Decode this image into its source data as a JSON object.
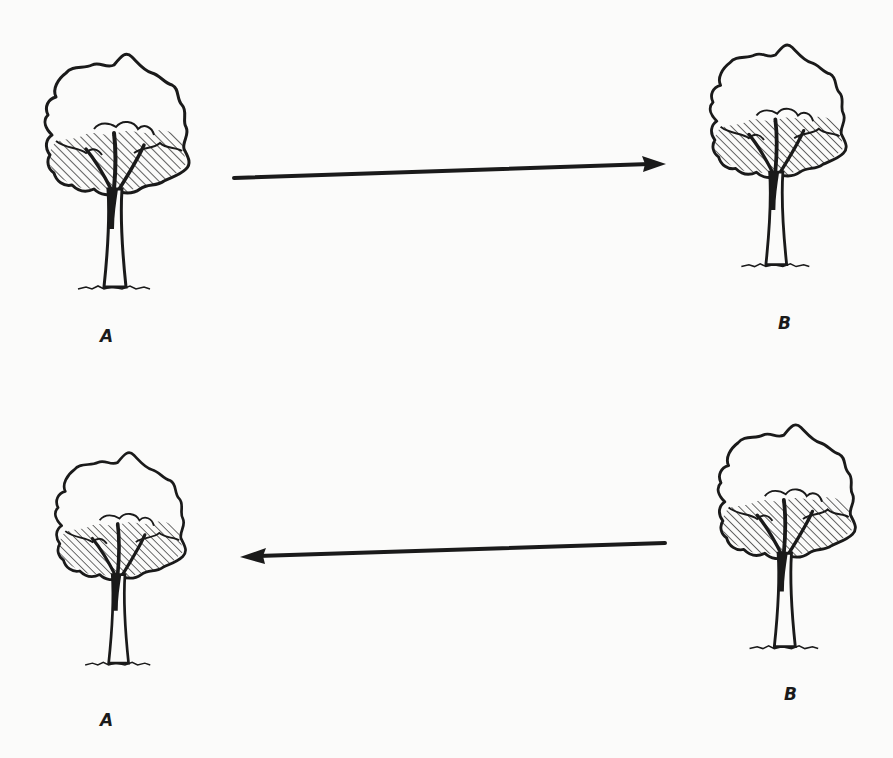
{
  "diagram": {
    "ink_color": "#1a1a1a",
    "background": "#fbfbfa",
    "rows": [
      {
        "left": {
          "label": "A",
          "icon": "tree-icon"
        },
        "right": {
          "label": "B",
          "icon": "tree-icon"
        },
        "arrow": {
          "direction": "left-to-right",
          "from": "A",
          "to": "B"
        }
      },
      {
        "left": {
          "label": "A",
          "icon": "tree-icon"
        },
        "right": {
          "label": "B",
          "icon": "tree-icon"
        },
        "arrow": {
          "direction": "right-to-left",
          "from": "B",
          "to": "A"
        }
      }
    ]
  }
}
